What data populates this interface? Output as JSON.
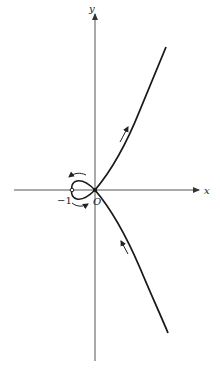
{
  "diagram": {
    "type": "parametric-curve-with-loop",
    "axes": {
      "x_label": "x",
      "y_label": "y",
      "origin_label": "O"
    },
    "annotations": {
      "neg_one_label": "−1"
    },
    "direction_arrows": [
      {
        "branch": "upper",
        "direction": "away-from-origin"
      },
      {
        "branch": "lower",
        "direction": "toward-origin"
      },
      {
        "branch": "loop-top",
        "direction": "leftward"
      },
      {
        "branch": "loop-bottom",
        "direction": "rightward"
      }
    ],
    "colors": {
      "curve": "#1a1a1a",
      "axes": "#444444",
      "background": "#ffffff"
    }
  }
}
